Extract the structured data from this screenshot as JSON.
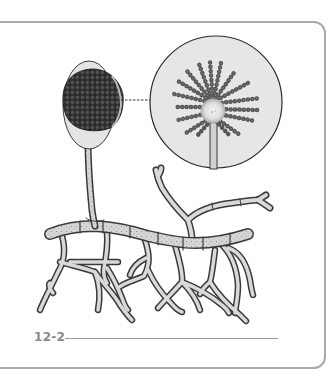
{
  "figure": {
    "label": "12-2",
    "parts": [
      {
        "name": "spore-head",
        "shape": "dark spherical cluster in pale ellipse"
      },
      {
        "name": "magnified-inset",
        "shape": "circle with radiating spore chains around central vesicle"
      },
      {
        "name": "conidiophore-stalk",
        "shape": "vertical tube"
      },
      {
        "name": "septate-hyphae",
        "shape": "branching segmented tubes"
      }
    ],
    "colors": {
      "frame": "#a9a9a9",
      "outline": "#3a3a3a",
      "hypha_fill": "#d9d9d9",
      "inset_fill": "#e6e6e6",
      "spore_dark": "#2e2e2e",
      "spore_chain": "#5a5a5a",
      "label": "#8a8a8a"
    }
  }
}
